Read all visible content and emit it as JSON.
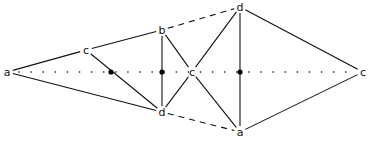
{
  "diagram": {
    "type": "graph",
    "nodes": [
      {
        "id": "a_left",
        "label": "a"
      },
      {
        "id": "c_upper",
        "label": "c"
      },
      {
        "id": "b",
        "label": "b"
      },
      {
        "id": "d_top",
        "label": "d"
      },
      {
        "id": "d_mid",
        "label": "d"
      },
      {
        "id": "a_bottom",
        "label": "a"
      },
      {
        "id": "c_center",
        "label": "c"
      },
      {
        "id": "c_right",
        "label": "c"
      }
    ],
    "junctions": [
      "j1",
      "j2",
      "j3"
    ],
    "edges": [
      {
        "from": "a_left",
        "to": "c_upper",
        "style": "solid"
      },
      {
        "from": "c_upper",
        "to": "b",
        "style": "solid"
      },
      {
        "from": "a_left",
        "to": "d_mid",
        "style": "solid"
      },
      {
        "from": "c_upper",
        "to": "d_mid",
        "style": "solid",
        "via": "j1"
      },
      {
        "from": "b",
        "to": "d_mid",
        "style": "solid",
        "via": "j2"
      },
      {
        "from": "b",
        "to": "c_center",
        "style": "solid"
      },
      {
        "from": "c_center",
        "to": "d_mid",
        "style": "solid"
      },
      {
        "from": "b",
        "to": "d_top",
        "style": "dashed"
      },
      {
        "from": "d_mid",
        "to": "a_bottom",
        "style": "dashed"
      },
      {
        "from": "d_top",
        "to": "c_center",
        "style": "solid"
      },
      {
        "from": "c_center",
        "to": "a_bottom",
        "style": "solid"
      },
      {
        "from": "d_top",
        "to": "a_bottom",
        "style": "solid",
        "via": "j3"
      },
      {
        "from": "d_top",
        "to": "c_right",
        "style": "solid"
      },
      {
        "from": "a_bottom",
        "to": "c_right",
        "style": "solid"
      },
      {
        "from": "a_left",
        "to": "c_right",
        "style": "dotted"
      }
    ]
  }
}
